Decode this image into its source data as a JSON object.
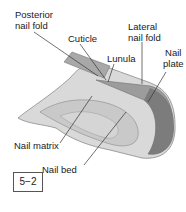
{
  "labels": {
    "posterior_nail_fold": [
      "Posterior",
      "nail fold"
    ],
    "cuticle": "Cuticle",
    "lateral_nail_fold": [
      "Lateral",
      "nail fold"
    ],
    "lunula": "Lunula",
    "nail_plate": [
      "Nail",
      "plate"
    ],
    "nail_matrix": "Nail matrix",
    "nail_bed": "Nail bed"
  },
  "figure_number": "5−2",
  "colors": {
    "skin_light": "#d6d6d6",
    "skin_mid": "#bdbdbd",
    "skin_dark": "#8f8f8f",
    "plate": "#9a9a9a",
    "line": "#333333"
  }
}
